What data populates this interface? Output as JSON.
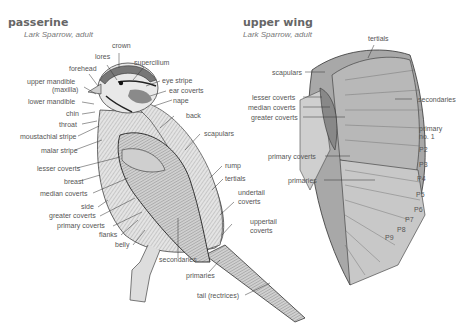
{
  "passerine": {
    "title": "passerine",
    "subtitle": "Lark Sparrow, adult",
    "labels": {
      "crown": "crown",
      "lores": "lores",
      "supercilium": "supercilium",
      "forehead": "forehead",
      "upper_mandible": "upper mandible",
      "maxilla": "(maxilla)",
      "eye_stripe": "eye stripe",
      "ear_coverts": "ear coverts",
      "lower_mandible": "lower mandible",
      "nape": "nape",
      "chin": "chin",
      "throat": "throat",
      "back": "back",
      "moustachial_stripe": "moustachial stripe",
      "malar_stripe": "malar stripe",
      "scapulars": "scapulars",
      "lesser_coverts": "lesser coverts",
      "breast": "breast",
      "rump": "rump",
      "tertials": "tertials",
      "median_coverts": "median coverts",
      "undertail_coverts_1": "undertail",
      "undertail_coverts_2": "coverts",
      "side": "side",
      "greater_coverts": "greater coverts",
      "uppertail_coverts_1": "uppertail",
      "uppertail_coverts_2": "coverts",
      "primary_coverts": "primary coverts",
      "flanks": "flanks",
      "belly": "belly",
      "secondaries": "secondaries",
      "primaries": "primaries",
      "tail": "tail (rectrices)"
    }
  },
  "upper_wing": {
    "title": "upper wing",
    "subtitle": "Lark Sparrow, adult",
    "labels": {
      "tertials": "tertials",
      "scapulars": "scapulars",
      "lesser_coverts": "lesser coverts",
      "median_coverts": "median coverts",
      "greater_coverts": "greater coverts",
      "secondaries": "secondaries",
      "primary_no1_a": "primary",
      "primary_no1_b": "no. 1",
      "primary_coverts": "primary coverts",
      "primaries": "primaries",
      "p2": "P2",
      "p3": "P3",
      "p4": "P4",
      "p5": "P5",
      "p6": "P6",
      "p7": "P7",
      "p8": "P8",
      "p9": "P9"
    }
  }
}
